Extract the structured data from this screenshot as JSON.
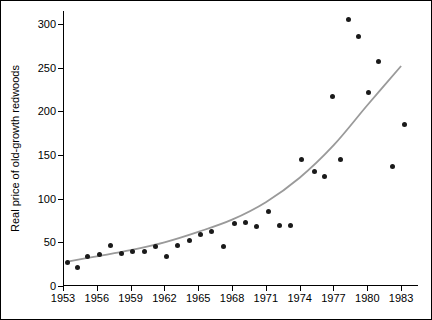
{
  "chart_data": {
    "type": "scatter",
    "title": "",
    "xlabel": "",
    "ylabel": "Real price of old-growth redwoods",
    "xlim": [
      1953,
      1984.5
    ],
    "ylim": [
      0,
      315
    ],
    "grid": false,
    "legend": "none",
    "x_ticks": [
      1953,
      1956,
      1959,
      1962,
      1965,
      1968,
      1971,
      1974,
      1977,
      1980,
      1983
    ],
    "y_ticks": [
      0,
      50,
      100,
      150,
      200,
      250,
      300
    ],
    "series": [
      {
        "name": "Real price of old-growth redwoods",
        "marker": "filled-circle",
        "color": "#1a1a1a",
        "points": [
          {
            "x": 1953.4,
            "y": 27
          },
          {
            "x": 1954.3,
            "y": 21
          },
          {
            "x": 1955.2,
            "y": 34
          },
          {
            "x": 1956.2,
            "y": 36
          },
          {
            "x": 1957.2,
            "y": 46
          },
          {
            "x": 1958.2,
            "y": 37
          },
          {
            "x": 1959.2,
            "y": 39
          },
          {
            "x": 1960.2,
            "y": 40
          },
          {
            "x": 1961.2,
            "y": 45
          },
          {
            "x": 1962.2,
            "y": 34
          },
          {
            "x": 1963.2,
            "y": 46
          },
          {
            "x": 1964.2,
            "y": 52
          },
          {
            "x": 1965.2,
            "y": 59
          },
          {
            "x": 1966.2,
            "y": 63
          },
          {
            "x": 1967.2,
            "y": 45
          },
          {
            "x": 1968.2,
            "y": 72
          },
          {
            "x": 1969.2,
            "y": 73
          },
          {
            "x": 1970.2,
            "y": 68
          },
          {
            "x": 1971.2,
            "y": 85
          },
          {
            "x": 1972.2,
            "y": 69
          },
          {
            "x": 1973.2,
            "y": 69
          },
          {
            "x": 1974.2,
            "y": 145
          },
          {
            "x": 1975.3,
            "y": 131
          },
          {
            "x": 1976.2,
            "y": 125
          },
          {
            "x": 1976.9,
            "y": 217
          },
          {
            "x": 1977.6,
            "y": 145
          },
          {
            "x": 1978.3,
            "y": 305
          },
          {
            "x": 1979.2,
            "y": 286
          },
          {
            "x": 1980.1,
            "y": 222
          },
          {
            "x": 1981.0,
            "y": 257
          },
          {
            "x": 1982.2,
            "y": 137
          },
          {
            "x": 1983.3,
            "y": 185
          }
        ]
      }
    ],
    "trend": {
      "name": "fitted exponential trend",
      "color": "#9a9a9a",
      "points": [
        {
          "x": 1953.4,
          "y": 28
        },
        {
          "x": 1956.0,
          "y": 34
        },
        {
          "x": 1959.0,
          "y": 41
        },
        {
          "x": 1962.0,
          "y": 50
        },
        {
          "x": 1965.0,
          "y": 62
        },
        {
          "x": 1968.0,
          "y": 76
        },
        {
          "x": 1971.0,
          "y": 96
        },
        {
          "x": 1974.0,
          "y": 124
        },
        {
          "x": 1977.0,
          "y": 161
        },
        {
          "x": 1980.0,
          "y": 207
        },
        {
          "x": 1983.0,
          "y": 252
        }
      ]
    }
  }
}
